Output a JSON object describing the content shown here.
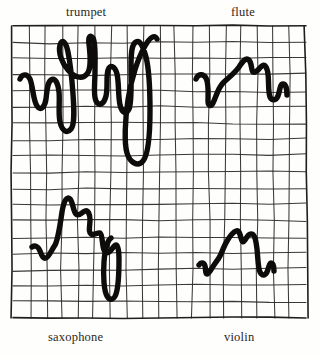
{
  "figure": {
    "kind": "hand-drawn-waveform-figure",
    "background_color": "#fefefd",
    "ink_color": "#0d0c0b",
    "grid_color": "#2c2a28"
  },
  "labels": {
    "top_left": "trumpet",
    "top_right": "flute",
    "bottom_left": "saxophone",
    "bottom_right": "violin"
  },
  "grid": {
    "left": 13,
    "top": 26,
    "right": 306,
    "bottom": 318,
    "columns": 18,
    "rows": 18,
    "hand_drawn": true
  },
  "chart_data": {
    "type": "line",
    "title": "",
    "subtitle": "",
    "xlabel": "",
    "ylabel": "",
    "grid": true,
    "legend_position": "corners",
    "series": [
      {
        "name": "trumpet",
        "label_position": "top-left",
        "quadrant": "top-left",
        "path": "M 20 79 C 22 74, 27 73, 30 79 C 33 86, 33 100, 37 106 C 41 112, 45 106, 46 99 C 47 91, 47 83, 51 80 C 55 77, 58 83, 59 92 C 60 101, 58 113, 60 122 C 62 131, 67 134, 71 129 C 75 124, 74 108, 73 94 C 72 80, 70 62, 68 52 C 66 42, 62 38, 60 45 C 58 53, 62 63, 68 70 C 74 77, 82 80, 87 74 C 92 68, 90 53, 89 44 C 88 37, 90 34, 93 38 C 96 43, 95 58, 95 71 C 95 84, 93 95, 96 101 C 99 107, 104 104, 106 96 C 108 88, 106 76, 108 70 C 110 64, 115 66, 117 74 C 119 82, 118 96, 120 105 C 122 113, 126 115, 129 109 C 132 103, 131 84, 131 66 C 131 52, 132 44, 136 42 C 140 40, 143 46, 146 57 C 149 69, 150 90, 150 110 C 150 135, 148 155, 143 161 C 138 167, 130 163, 127 153 C 124 143, 125 120, 128 100 C 131 79, 138 58, 145 46 C 150 37, 155 34, 157 39",
        "amplitude": "high",
        "character": "complex, jagged, many overtones"
      },
      {
        "name": "flute",
        "label_position": "top-right",
        "quadrant": "top-right",
        "path": "M 196 79 C 198 74, 203 73, 206 78 C 209 84, 208 94, 208 101 C 208 106, 211 107, 213 103 C 216 97, 218 88, 223 83 C 228 78, 234 74, 239 67 C 243 61, 246 57, 249 60 C 252 63, 251 70, 253 72 C 256 74, 259 68, 262 66 C 265 64, 267 67, 268 74 C 269 82, 268 92, 270 97 C 272 101, 276 101, 278 96 C 280 90, 280 84, 283 84 C 286 84, 287 90, 287 95",
        "amplitude": "medium",
        "character": "smooth, rounded, nearly sinusoidal"
      },
      {
        "name": "saxophone",
        "label_position": "bottom-left",
        "quadrant": "bottom-left",
        "path": "M 32 247 C 35 245, 38 246, 40 251 C 42 256, 43 259, 46 258 C 49 257, 51 251, 55 245 C 58 240, 60 226, 62 212 C 64 200, 67 196, 70 199 C 73 202, 73 211, 76 214 C 79 217, 82 212, 85 211 C 88 210, 90 214, 90 220 C 90 226, 88 232, 91 234 C 94 236, 98 232, 100 233 C 102 234, 102 240, 103 246 C 104 252, 106 254, 109 252 C 112 250, 114 245, 116 245 C 118 245, 119 250, 119 259 C 119 275, 118 288, 116 294 C 114 300, 110 301, 107 296 C 104 291, 103 276, 104 262 C 105 248, 108 240, 111 238",
        "amplitude": "high",
        "character": "reedy, sawtooth-like with sharp turns"
      },
      {
        "name": "violin",
        "label_position": "bottom-right",
        "quadrant": "bottom-right",
        "path": "M 199 265 C 201 262, 204 262, 205 266 C 206 270, 205 274, 207 274 C 209 274, 211 269, 214 265 C 216 262, 218 260, 220 256 C 222 252, 224 246, 227 241 C 230 236, 233 232, 236 231 C 239 230, 240 234, 241 238 C 242 242, 243 243, 245 240 C 247 237, 249 233, 252 234 C 255 235, 256 241, 257 249 C 258 259, 258 268, 260 272 C 262 276, 265 276, 267 272 C 269 268, 269 263, 271 263 C 273 263, 274 267, 274 271",
        "amplitude": "medium",
        "character": "rich, stepped, string-like"
      }
    ]
  }
}
